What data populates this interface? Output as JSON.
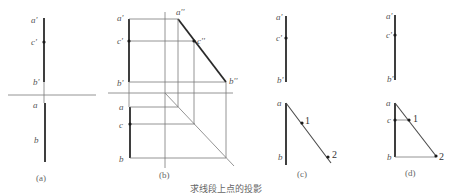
{
  "figure": {
    "caption": "求线段上点的投影",
    "panels": [
      {
        "id": "a",
        "caption": "(a)",
        "labels": {
          "a_prime": "a'",
          "c_prime": "c'",
          "b_prime": "b'",
          "a": "a",
          "b": "b"
        }
      },
      {
        "id": "b",
        "caption": "(b)",
        "labels": {
          "a_prime": "a'",
          "c_prime": "c'",
          "b_prime": "b'",
          "a_dprime": "a''",
          "c_dprime": "c''",
          "b_dprime": "b''",
          "a": "a",
          "c": "c",
          "b": "b"
        }
      },
      {
        "id": "c",
        "caption": "(c)",
        "labels": {
          "a_prime": "a'",
          "c_prime": "c'",
          "b_prime": "b'",
          "a": "a",
          "b": "b",
          "p1": "1",
          "p2": "2"
        }
      },
      {
        "id": "d",
        "caption": "(d)",
        "labels": {
          "a_prime": "a'",
          "c_prime": "c'",
          "b_prime": "b'",
          "a": "a",
          "c": "c",
          "b": "b",
          "p1": "1",
          "p2": "2"
        }
      }
    ]
  }
}
